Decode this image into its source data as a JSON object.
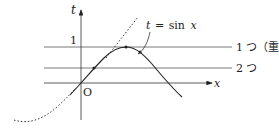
{
  "diagram": {
    "axes": {
      "x_label": "x",
      "y_label": "t",
      "origin_label": "O",
      "tick_one": "1"
    },
    "curve_label": "t = sin x",
    "curve_label_parts": {
      "lhs": "t",
      "eq": "=",
      "fn": "sin",
      "var": "x"
    },
    "horizontal_lines": [
      {
        "level": "t=1",
        "label": "1 つ（重解）"
      },
      {
        "level": "0<t<1",
        "label": "2 つ"
      }
    ],
    "colors": {
      "line": "#222222",
      "grid": "#555555"
    }
  }
}
